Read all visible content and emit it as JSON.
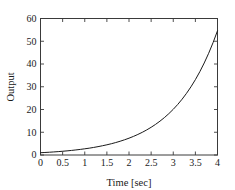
{
  "chart_data": {
    "type": "line",
    "title": "",
    "xlabel": "Time [sec]",
    "ylabel": "Output",
    "xlim": [
      0,
      4
    ],
    "ylim": [
      0,
      60
    ],
    "grid": false,
    "legend": null,
    "xticks": [
      "0",
      "0.5",
      "1",
      "1.5",
      "2",
      "2.5",
      "3",
      "3.5",
      "4"
    ],
    "xtick_values": [
      0,
      0.5,
      1,
      1.5,
      2,
      2.5,
      3,
      3.5,
      4
    ],
    "yticks": [
      "0",
      "10",
      "20",
      "30",
      "40",
      "50",
      "60"
    ],
    "ytick_values": [
      0,
      10,
      20,
      30,
      40,
      50,
      60
    ],
    "series": [
      {
        "name": "Output",
        "color": "#1a1a1a",
        "x": [
          0,
          0.1,
          0.2,
          0.3,
          0.4,
          0.5,
          0.6,
          0.7,
          0.8,
          0.9,
          1,
          1.1,
          1.2,
          1.3,
          1.4,
          1.5,
          1.6,
          1.7,
          1.8,
          1.9,
          2,
          2.1,
          2.2,
          2.3,
          2.4,
          2.5,
          2.6,
          2.7,
          2.8,
          2.9,
          3,
          3.1,
          3.2,
          3.3,
          3.4,
          3.5,
          3.6,
          3.7,
          3.8,
          3.9,
          4
        ],
        "y": [
          1,
          1.11,
          1.22,
          1.35,
          1.49,
          1.65,
          1.82,
          2.01,
          2.23,
          2.46,
          2.72,
          3.0,
          3.32,
          3.67,
          4.06,
          4.48,
          4.95,
          5.47,
          6.05,
          6.69,
          7.39,
          8.17,
          9.03,
          9.97,
          11.02,
          12.18,
          13.46,
          14.88,
          16.44,
          18.17,
          20.09,
          22.2,
          24.53,
          27.11,
          29.96,
          33.12,
          36.6,
          40.45,
          44.7,
          49.4,
          54.6
        ]
      }
    ]
  },
  "axes": {
    "frame_color": "#3a3a3a",
    "background": "#ffffff"
  }
}
